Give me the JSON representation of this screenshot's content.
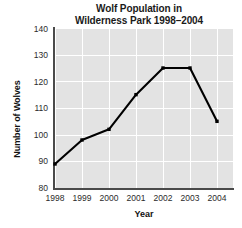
{
  "chart_data": {
    "type": "line",
    "title": "Wolf Population in Wilderness Park 1998–2004",
    "title_line1": "Wolf Population in",
    "title_line2": "Wilderness Park 1998–2004",
    "xlabel": "Year",
    "ylabel": "Number of Wolves",
    "categories": [
      "1998",
      "1999",
      "2000",
      "2001",
      "2002",
      "2003",
      "2004"
    ],
    "x": [
      1998,
      1999,
      2000,
      2001,
      2002,
      2003,
      2004
    ],
    "values": [
      89,
      98,
      102,
      115,
      125,
      125,
      105
    ],
    "series": [
      {
        "name": "Wolf population",
        "values": [
          89,
          98,
          102,
          115,
          125,
          125,
          105
        ]
      }
    ],
    "ylim": [
      80,
      140
    ],
    "yticks": [
      80,
      90,
      100,
      110,
      120,
      130,
      140
    ],
    "ytick_labels": [
      "80",
      "90",
      "100",
      "110",
      "120",
      "130",
      "140"
    ],
    "xticks": [
      1998,
      1999,
      2000,
      2001,
      2002,
      2003,
      2004
    ],
    "xtick_labels": [
      "1998",
      "1999",
      "2000",
      "2001",
      "2002",
      "2003",
      "2004"
    ],
    "grid": true,
    "grid_color": "#ffffff",
    "plot_background": "#e3e3e3",
    "line_color": "#000000",
    "marker": "square",
    "legend": false,
    "legend_position": "none"
  }
}
